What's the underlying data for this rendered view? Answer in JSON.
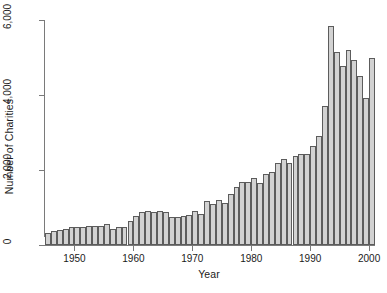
{
  "chart_data": {
    "type": "bar",
    "title": "",
    "xlabel": "Year",
    "ylabel": "Number of Charities",
    "xlim": [
      1945,
      2001
    ],
    "ylim": [
      0,
      6000
    ],
    "grid": false,
    "legend": null,
    "xticks": [
      1950,
      1960,
      1970,
      1980,
      1990,
      2000
    ],
    "xtick_labels": [
      "1950",
      "1960",
      "1970",
      "1980",
      "1990",
      "2000"
    ],
    "yticks": [
      0,
      2000,
      4000,
      6000
    ],
    "ytick_labels": [
      "0",
      "2,000",
      "4,000",
      "6,000"
    ],
    "bar_fill": "#d2d2d2",
    "bar_edge": "#5c5c5c",
    "axis_color": "#7a7a7a",
    "categories": [
      1945,
      1946,
      1947,
      1948,
      1949,
      1950,
      1951,
      1952,
      1953,
      1954,
      1955,
      1956,
      1957,
      1958,
      1959,
      1960,
      1961,
      1962,
      1963,
      1964,
      1965,
      1966,
      1967,
      1968,
      1969,
      1970,
      1971,
      1972,
      1973,
      1974,
      1975,
      1976,
      1977,
      1978,
      1979,
      1980,
      1981,
      1982,
      1983,
      1984,
      1985,
      1986,
      1987,
      1988,
      1989,
      1990,
      1991,
      1992,
      1993,
      1994,
      1995,
      1996,
      1997,
      1998,
      1999,
      2000
    ],
    "values": [
      330,
      380,
      400,
      420,
      470,
      480,
      470,
      520,
      520,
      510,
      570,
      430,
      480,
      490,
      640,
      780,
      880,
      920,
      870,
      900,
      880,
      740,
      760,
      770,
      790,
      900,
      830,
      1180,
      1100,
      1210,
      1130,
      1350,
      1560,
      1690,
      1680,
      1790,
      1650,
      1890,
      1940,
      2200,
      2290,
      2200,
      2370,
      2440,
      2440,
      2650,
      2900,
      3700,
      5830,
      5150,
      4770,
      5200,
      4930,
      4510,
      3930,
      5000
    ]
  }
}
